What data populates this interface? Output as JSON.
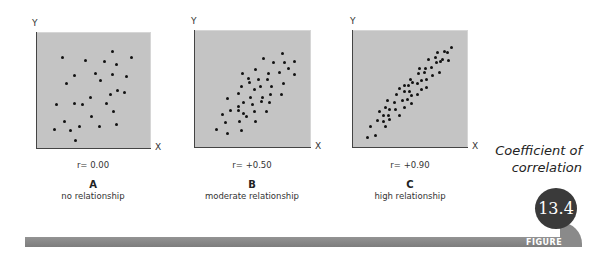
{
  "title": {
    "line1": "Coefficient of",
    "line2": "correlation"
  },
  "badge": {
    "number": "13.4",
    "label": "FIGURE"
  },
  "panels": [
    {
      "letter": "A",
      "description": "no relationship",
      "r_label": "r= 0.00",
      "x_axis": "X",
      "y_axis": "Y"
    },
    {
      "letter": "B",
      "description": "moderate relationship",
      "r_label": "r= +0.50",
      "x_axis": "X",
      "y_axis": "Y"
    },
    {
      "letter": "C",
      "description": "high relationship",
      "r_label": "r= +0.90",
      "x_axis": "X",
      "y_axis": "Y"
    }
  ],
  "colors": {
    "plot_bg": "#c4c4c4",
    "dot": "#111111",
    "bar": "#8a8a8a",
    "badge": "#3a3a3a"
  },
  "chart_data": [
    {
      "type": "scatter",
      "title": "A: no relationship",
      "annotation": "r= 0.00",
      "xlabel": "X",
      "ylabel": "Y",
      "grid": false,
      "points": [
        [
          62,
          57
        ],
        [
          85,
          60
        ],
        [
          104,
          61
        ],
        [
          112,
          51
        ],
        [
          116,
          64
        ],
        [
          131,
          57
        ],
        [
          74,
          75
        ],
        [
          95,
          73
        ],
        [
          112,
          74
        ],
        [
          126,
          76
        ],
        [
          100,
          80
        ],
        [
          66,
          83
        ],
        [
          117,
          90
        ],
        [
          124,
          92
        ],
        [
          110,
          94
        ],
        [
          90,
          97
        ],
        [
          56,
          104
        ],
        [
          74,
          103
        ],
        [
          82,
          104
        ],
        [
          106,
          103
        ],
        [
          113,
          111
        ],
        [
          91,
          116
        ],
        [
          64,
          121
        ],
        [
          79,
          126
        ],
        [
          99,
          126
        ],
        [
          116,
          124
        ],
        [
          54,
          129
        ],
        [
          70,
          130
        ],
        [
          75,
          140
        ]
      ]
    },
    {
      "type": "scatter",
      "title": "B: moderate relationship",
      "annotation": "r= +0.50",
      "xlabel": "X",
      "ylabel": "Y",
      "grid": false,
      "points": [
        [
          263,
          58
        ],
        [
          282,
          53
        ],
        [
          273,
          62
        ],
        [
          284,
          62
        ],
        [
          294,
          61
        ],
        [
          255,
          69
        ],
        [
          288,
          68
        ],
        [
          242,
          73
        ],
        [
          268,
          73
        ],
        [
          279,
          72
        ],
        [
          294,
          74
        ],
        [
          248,
          78
        ],
        [
          258,
          79
        ],
        [
          267,
          79
        ],
        [
          249,
          82
        ],
        [
          241,
          86
        ],
        [
          260,
          86
        ],
        [
          271,
          86
        ],
        [
          283,
          83
        ],
        [
          254,
          89
        ],
        [
          238,
          93
        ],
        [
          270,
          94
        ],
        [
          281,
          94
        ],
        [
          250,
          97
        ],
        [
          262,
          97
        ],
        [
          227,
          98
        ],
        [
          243,
          102
        ],
        [
          261,
          101
        ],
        [
          269,
          102
        ],
        [
          252,
          104
        ],
        [
          238,
          106
        ],
        [
          230,
          110
        ],
        [
          238,
          110
        ],
        [
          254,
          111
        ],
        [
          266,
          111
        ],
        [
          243,
          113
        ],
        [
          222,
          114
        ],
        [
          246,
          116
        ],
        [
          225,
          122
        ],
        [
          239,
          121
        ],
        [
          255,
          121
        ],
        [
          216,
          129
        ],
        [
          241,
          130
        ],
        [
          227,
          133
        ]
      ]
    },
    {
      "type": "scatter",
      "title": "C: high relationship",
      "annotation": "r= +0.90",
      "xlabel": "X",
      "ylabel": "Y",
      "grid": false,
      "points": [
        [
          451,
          47
        ],
        [
          444,
          51
        ],
        [
          447,
          52
        ],
        [
          437,
          52
        ],
        [
          435,
          57
        ],
        [
          442,
          59
        ],
        [
          440,
          61
        ],
        [
          448,
          60
        ],
        [
          428,
          59
        ],
        [
          436,
          62
        ],
        [
          419,
          68
        ],
        [
          425,
          68
        ],
        [
          431,
          67
        ],
        [
          424,
          72
        ],
        [
          418,
          73
        ],
        [
          439,
          72
        ],
        [
          432,
          75
        ],
        [
          410,
          79
        ],
        [
          421,
          80
        ],
        [
          426,
          79
        ],
        [
          412,
          82
        ],
        [
          404,
          85
        ],
        [
          417,
          83
        ],
        [
          408,
          85
        ],
        [
          426,
          87
        ],
        [
          421,
          89
        ],
        [
          399,
          88
        ],
        [
          409,
          91
        ],
        [
          404,
          91
        ],
        [
          396,
          94
        ],
        [
          411,
          95
        ],
        [
          417,
          94
        ],
        [
          407,
          99
        ],
        [
          402,
          100
        ],
        [
          387,
          100
        ],
        [
          394,
          102
        ],
        [
          411,
          103
        ],
        [
          404,
          107
        ],
        [
          385,
          107
        ],
        [
          389,
          109
        ],
        [
          395,
          109
        ],
        [
          379,
          111
        ],
        [
          383,
          115
        ],
        [
          388,
          115
        ],
        [
          399,
          115
        ],
        [
          377,
          120
        ],
        [
          383,
          121
        ],
        [
          389,
          119
        ],
        [
          370,
          126
        ],
        [
          385,
          126
        ],
        [
          367,
          137
        ],
        [
          375,
          135
        ]
      ]
    }
  ]
}
